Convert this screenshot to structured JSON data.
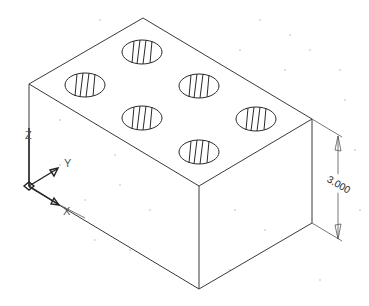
{
  "drawing": {
    "type": "isometric-cad-model",
    "description": "Rectangular block with six drilled holes, isometric view",
    "colors": {
      "background": "#ffffff",
      "lines": "#3a3a3a",
      "grid": "#b8b8b8"
    }
  },
  "dimension": {
    "value": "3.000",
    "orientation": "vertical",
    "feature": "block height"
  },
  "ucs_icon": {
    "labels": {
      "x": "X",
      "y": "Y",
      "z": "Z"
    }
  },
  "holes": {
    "count": 6,
    "centers": [
      [
        142,
        52
      ],
      [
        85,
        85
      ],
      [
        199,
        86
      ],
      [
        142,
        118
      ],
      [
        256,
        119
      ],
      [
        199,
        152
      ]
    ]
  }
}
